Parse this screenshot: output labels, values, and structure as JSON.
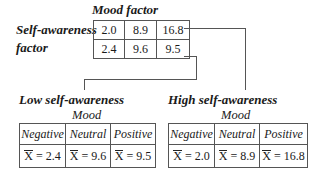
{
  "top": {
    "column_factor_label": "Mood factor",
    "row_factor_label_line1": "Self-awareness",
    "row_factor_label_line2": "factor",
    "rows": [
      [
        "2.0",
        "8.9",
        "16.8"
      ],
      [
        "2.4",
        "9.6",
        "9.5"
      ]
    ]
  },
  "low": {
    "title": "Low self-awareness",
    "subtitle": "Mood",
    "headers": [
      "Negative",
      "Neutral",
      "Positive"
    ],
    "mean_symbol": "X",
    "values": [
      "= 2.4",
      "= 9.6",
      "= 9.5"
    ]
  },
  "high": {
    "title": "High self-awareness",
    "subtitle": "Mood",
    "headers": [
      "Negative",
      "Neutral",
      "Positive"
    ],
    "mean_symbol": "X",
    "values": [
      "= 2.0",
      "= 8.9",
      "= 16.8"
    ]
  }
}
